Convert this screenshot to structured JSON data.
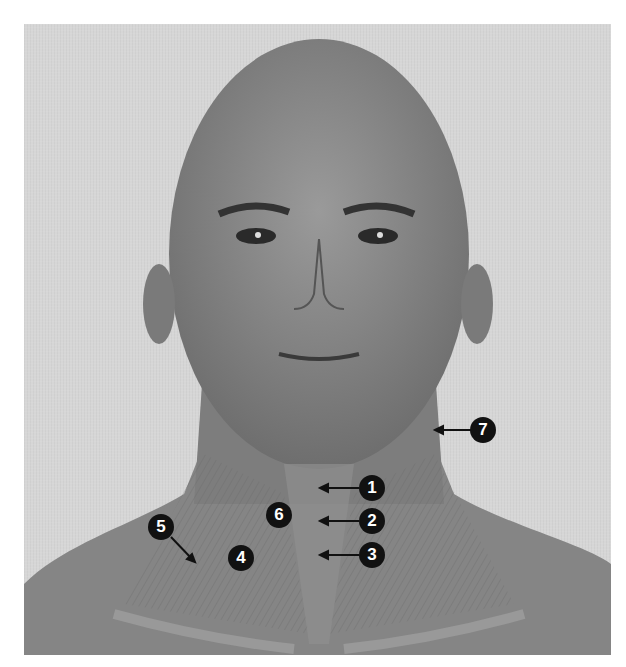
{
  "figure": {
    "colors": {
      "background": "#d6d6d6",
      "skin": "#8c8c8c",
      "label_fill": "#111111",
      "label_text": "#ffffff"
    },
    "labels": [
      {
        "id": "1",
        "text": "1",
        "x": 372,
        "y": 488
      },
      {
        "id": "2",
        "text": "2",
        "x": 372,
        "y": 521
      },
      {
        "id": "3",
        "text": "3",
        "x": 372,
        "y": 555
      },
      {
        "id": "4",
        "text": "4",
        "x": 241,
        "y": 558
      },
      {
        "id": "5",
        "text": "5",
        "x": 161,
        "y": 527
      },
      {
        "id": "6",
        "text": "6",
        "x": 279,
        "y": 515
      },
      {
        "id": "7",
        "text": "7",
        "x": 483,
        "y": 430
      }
    ]
  }
}
